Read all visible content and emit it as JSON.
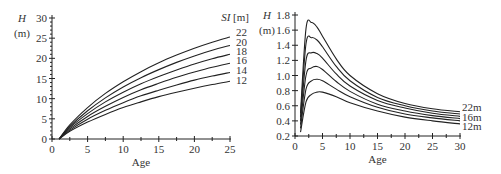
{
  "chart_data": [
    {
      "type": "line",
      "title": "",
      "xlabel": "Age",
      "ylabel": "H",
      "ylabel_unit": "(m)",
      "xlim": [
        0,
        25
      ],
      "ylim": [
        0,
        30
      ],
      "xticks": [
        "0",
        "5",
        "10",
        "15",
        "20",
        "25"
      ],
      "yticks": [
        "0",
        "5",
        "10",
        "15",
        "20",
        "25",
        "30"
      ],
      "grid": false,
      "legend_title": "SI [m]",
      "legend_position": "right, at line ends",
      "x": [
        1,
        2.5,
        5,
        7.5,
        10,
        12.5,
        15,
        17.5,
        20,
        22.5,
        25
      ],
      "series": [
        {
          "name": "22",
          "values": [
            0,
            3.5,
            7.8,
            11.3,
            14.2,
            16.7,
            18.9,
            20.8,
            22.5,
            24.0,
            25.3
          ]
        },
        {
          "name": "20",
          "values": [
            0,
            3.1,
            7.0,
            10.2,
            12.9,
            15.2,
            17.2,
            19.0,
            20.6,
            22.0,
            23.2
          ]
        },
        {
          "name": "18",
          "values": [
            0,
            2.8,
            6.3,
            9.2,
            11.6,
            13.7,
            15.5,
            17.1,
            18.6,
            19.9,
            21.0
          ]
        },
        {
          "name": "16",
          "values": [
            0,
            2.5,
            5.6,
            8.1,
            10.3,
            12.2,
            13.8,
            15.3,
            16.6,
            17.8,
            18.8
          ]
        },
        {
          "name": "14",
          "values": [
            0,
            2.2,
            4.9,
            7.1,
            9.0,
            10.7,
            12.1,
            13.4,
            14.6,
            15.6,
            16.5
          ]
        },
        {
          "name": "12",
          "values": [
            0,
            1.9,
            4.2,
            6.1,
            7.8,
            9.2,
            10.5,
            11.6,
            12.6,
            13.5,
            14.3
          ]
        }
      ]
    },
    {
      "type": "line",
      "title": "",
      "xlabel": "Age",
      "ylabel": "H",
      "ylabel_unit": "(m)",
      "xlim": [
        0,
        30
      ],
      "ylim": [
        0.2,
        1.8
      ],
      "xticks": [
        "0",
        "5",
        "10",
        "15",
        "20",
        "25",
        "30"
      ],
      "yticks": [
        "0.2",
        "0.4",
        "0.6",
        "0.8",
        "1.0",
        "1.2",
        "1.4",
        "1.6",
        "1.8"
      ],
      "grid": false,
      "legend_position": "right, at line ends",
      "legend_entries": [
        "22m",
        "16m",
        "12m"
      ],
      "x": [
        1,
        2,
        3,
        4,
        5,
        7.5,
        10,
        15,
        20,
        25,
        30
      ],
      "series": [
        {
          "name": "22m",
          "values": [
            0.5,
            1.62,
            1.7,
            1.64,
            1.52,
            1.22,
            1.0,
            0.76,
            0.63,
            0.56,
            0.52
          ]
        },
        {
          "name": "20m",
          "values": [
            0.45,
            1.42,
            1.5,
            1.47,
            1.38,
            1.12,
            0.93,
            0.71,
            0.6,
            0.53,
            0.49
          ]
        },
        {
          "name": "18m",
          "values": [
            0.4,
            1.2,
            1.3,
            1.29,
            1.23,
            1.02,
            0.86,
            0.67,
            0.57,
            0.5,
            0.46
          ]
        },
        {
          "name": "16m",
          "values": [
            0.35,
            1.0,
            1.1,
            1.12,
            1.08,
            0.92,
            0.79,
            0.62,
            0.53,
            0.47,
            0.43
          ]
        },
        {
          "name": "14m",
          "values": [
            0.3,
            0.82,
            0.93,
            0.95,
            0.93,
            0.82,
            0.72,
            0.58,
            0.49,
            0.44,
            0.4
          ]
        },
        {
          "name": "12m",
          "values": [
            0.25,
            0.65,
            0.75,
            0.78,
            0.78,
            0.72,
            0.64,
            0.53,
            0.45,
            0.4,
            0.36
          ]
        }
      ]
    }
  ],
  "left": {
    "ylabel": "H",
    "yunit": "(m)",
    "xlabel": "Age",
    "legend_title": "SI [m]"
  },
  "right": {
    "ylabel": "H",
    "yunit": "(m)",
    "xlabel": "Age"
  }
}
